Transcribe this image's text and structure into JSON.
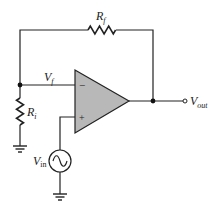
{
  "diagram": {
    "type": "op-amp non-inverting amplifier",
    "labels": {
      "feedback_resistor": "R",
      "feedback_resistor_sub": "f",
      "input_resistor": "R",
      "input_resistor_sub": "i",
      "feedback_voltage": "V",
      "feedback_voltage_sub": "f",
      "output_voltage": "V",
      "output_voltage_sub": "out",
      "input_voltage": "V",
      "input_voltage_sub": "in",
      "inverting_input": "−",
      "noninverting_input": "+"
    },
    "colors": {
      "wire": "#222222",
      "opamp_fill": "#b8b8b8"
    }
  }
}
